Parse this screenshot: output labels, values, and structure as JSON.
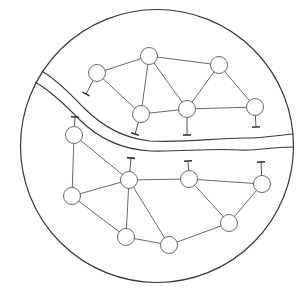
{
  "diagram": {
    "title": "",
    "colors": {
      "background": "#ffffff",
      "boundary": "#3a3a3a",
      "edge": "#6a6a6a",
      "node_fill": "#ffffff"
    },
    "clusters": [
      {
        "name": "north-bank",
        "nodes": [
          "A",
          "B",
          "C",
          "D",
          "E",
          "F"
        ],
        "edges": [
          [
            "A",
            "B"
          ],
          [
            "A",
            "C"
          ],
          [
            "B",
            "C"
          ],
          [
            "B",
            "D"
          ],
          [
            "B",
            "E"
          ],
          [
            "E",
            "D"
          ],
          [
            "E",
            "F"
          ],
          [
            "C",
            "D"
          ],
          [
            "D",
            "F"
          ]
        ],
        "antenna_nodes": [
          "A",
          "C",
          "D",
          "F"
        ],
        "antenna_direction": "toward-river"
      },
      {
        "name": "south-bank",
        "nodes": [
          "G",
          "H",
          "I",
          "J",
          "K",
          "L",
          "M",
          "N"
        ],
        "edges": [
          [
            "G",
            "I"
          ],
          [
            "G",
            "H"
          ],
          [
            "I",
            "H"
          ],
          [
            "I",
            "M"
          ],
          [
            "H",
            "M"
          ],
          [
            "H",
            "N"
          ],
          [
            "H",
            "J"
          ],
          [
            "J",
            "K"
          ],
          [
            "J",
            "L"
          ],
          [
            "K",
            "L"
          ],
          [
            "M",
            "N"
          ],
          [
            "N",
            "L"
          ]
        ],
        "antenna_nodes": [
          "G",
          "H",
          "J",
          "K"
        ],
        "antenna_direction": "toward-river"
      }
    ],
    "features": [
      "circular-boundary",
      "river"
    ]
  }
}
